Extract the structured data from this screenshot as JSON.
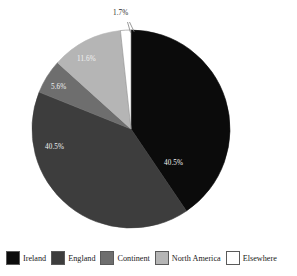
{
  "chart_data": {
    "type": "pie",
    "title": "",
    "categories": [
      "Ireland",
      "England",
      "Continent",
      "North America",
      "Elsewhere"
    ],
    "values": [
      40.5,
      40.5,
      5.6,
      11.6,
      1.7
    ],
    "value_labels": [
      "40.5%",
      "40.5%",
      "5.6%",
      "11.6%",
      "1.7%"
    ],
    "colors": [
      "#0b0b0b",
      "#3d3d3d",
      "#6e6e6e",
      "#b5b5b5",
      "#ffffff"
    ],
    "units": "percent",
    "start_angle_deg": 0,
    "direction": "clockwise",
    "legend_position": "bottom",
    "grid": false,
    "xlabel": "",
    "ylabel": "",
    "annotations": [
      {
        "text": "1.7%",
        "for": "Elsewhere",
        "placement": "outside-top",
        "leader_line": true
      }
    ]
  },
  "chart": {
    "labels": {
      "ireland": "40.5%",
      "england": "40.5%",
      "continent": "5.6%",
      "north_america": "11.6%",
      "elsewhere": "1.7%"
    }
  },
  "legend": {
    "items": [
      {
        "label": "Ireland",
        "color": "#0b0b0b"
      },
      {
        "label": "England",
        "color": "#3d3d3d"
      },
      {
        "label": "Continent",
        "color": "#6e6e6e"
      },
      {
        "label": "North America",
        "color": "#b5b5b5"
      },
      {
        "label": "Elsewhere",
        "color": "#ffffff"
      }
    ]
  }
}
